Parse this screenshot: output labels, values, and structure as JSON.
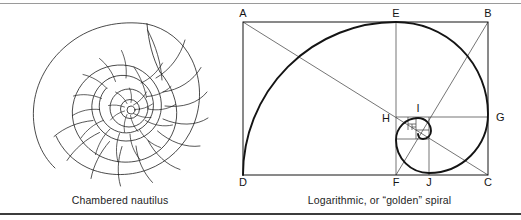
{
  "figure": {
    "width": 521,
    "height": 220,
    "background": "#ffffff",
    "rule_color_top": "#9a9a9a",
    "rule_color_bottom": "#3c3c3c",
    "ink_color": "#1d1d1d",
    "line_color": "#141414"
  },
  "panels": {
    "nautilus": {
      "caption": "Chambered nautilus",
      "subject": "chambered-nautilus-shell-cross-section",
      "chamber_count": 22,
      "center_x": 140,
      "center_y": 112
    },
    "golden": {
      "caption": "Logarithmic, or “golden” spiral",
      "subject": "golden-rectangle-with-logarithmic-spiral",
      "vertex_labels": [
        "A",
        "B",
        "C",
        "D",
        "E",
        "F",
        "G",
        "H",
        "I",
        "J"
      ],
      "labels": {
        "A": "A",
        "B": "B",
        "C": "C",
        "D": "D",
        "E": "E",
        "F": "F",
        "G": "G",
        "H": "H",
        "I": "I",
        "J": "J"
      }
    }
  }
}
